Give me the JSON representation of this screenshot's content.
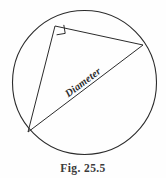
{
  "figure": {
    "caption": "Fig. 25.5",
    "diameter_label": "Diameter",
    "stroke_color": "#2b2b2b",
    "background_color": "#fefefe",
    "circle": {
      "center_x": 84.5,
      "center_y": 82.5,
      "radius": 72
    },
    "vertices": {
      "right_angle_vertex": {
        "x": 55,
        "y": 26
      },
      "left_vertex": {
        "x": 28,
        "y": 132
      },
      "right_vertex": {
        "x": 143,
        "y": 45
      }
    },
    "right_angle_marker": {
      "size": 9,
      "label": "right-angle"
    },
    "diameter_label_rotation_deg": -37
  }
}
